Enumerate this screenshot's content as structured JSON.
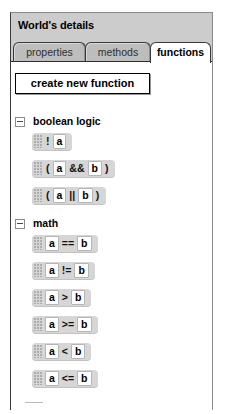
{
  "window": {
    "title": "World's details"
  },
  "tabs": [
    {
      "id": "properties",
      "label": "properties",
      "selected": false
    },
    {
      "id": "methods",
      "label": "methods",
      "selected": false
    },
    {
      "id": "functions",
      "label": "functions",
      "selected": true
    }
  ],
  "toolbar": {
    "create_label": "create new function"
  },
  "groups": [
    {
      "id": "boolean-logic",
      "label": "boolean logic",
      "expanded": true,
      "toggle_glyph": "minus",
      "items": [
        {
          "id": "not",
          "tokens": [
            {
              "t": "text",
              "v": "!"
            },
            {
              "t": "slot",
              "v": "a"
            }
          ]
        },
        {
          "id": "and",
          "tokens": [
            {
              "t": "text",
              "v": "("
            },
            {
              "t": "slot",
              "v": "a"
            },
            {
              "t": "text",
              "v": "&&"
            },
            {
              "t": "slot",
              "v": "b"
            },
            {
              "t": "text",
              "v": ")"
            }
          ]
        },
        {
          "id": "or",
          "tokens": [
            {
              "t": "text",
              "v": "("
            },
            {
              "t": "slot",
              "v": "a"
            },
            {
              "t": "text",
              "v": "||"
            },
            {
              "t": "slot",
              "v": "b"
            },
            {
              "t": "text",
              "v": ")"
            }
          ]
        }
      ]
    },
    {
      "id": "math",
      "label": "math",
      "expanded": true,
      "toggle_glyph": "minus",
      "items": [
        {
          "id": "eq",
          "tokens": [
            {
              "t": "slot",
              "v": "a"
            },
            {
              "t": "text",
              "v": "=="
            },
            {
              "t": "slot",
              "v": "b"
            }
          ]
        },
        {
          "id": "neq",
          "tokens": [
            {
              "t": "slot",
              "v": "a"
            },
            {
              "t": "text",
              "v": "!="
            },
            {
              "t": "slot",
              "v": "b"
            }
          ]
        },
        {
          "id": "gt",
          "tokens": [
            {
              "t": "slot",
              "v": "a"
            },
            {
              "t": "text",
              "v": ">"
            },
            {
              "t": "slot",
              "v": "b"
            }
          ]
        },
        {
          "id": "gte",
          "tokens": [
            {
              "t": "slot",
              "v": "a"
            },
            {
              "t": "text",
              "v": ">="
            },
            {
              "t": "slot",
              "v": "b"
            }
          ]
        },
        {
          "id": "lt",
          "tokens": [
            {
              "t": "slot",
              "v": "a"
            },
            {
              "t": "text",
              "v": "<"
            },
            {
              "t": "slot",
              "v": "b"
            }
          ]
        },
        {
          "id": "lte",
          "tokens": [
            {
              "t": "slot",
              "v": "a"
            },
            {
              "t": "text",
              "v": "<="
            },
            {
              "t": "slot",
              "v": "b"
            }
          ]
        }
      ]
    }
  ],
  "colors": {
    "panel_chrome": "#cccccc",
    "tab_unselected": "#bdbdbd",
    "tab_selected": "#ffffff",
    "block_fill": "#d6d6d6",
    "slot_fill": "#ffffff",
    "text": "#000000"
  }
}
